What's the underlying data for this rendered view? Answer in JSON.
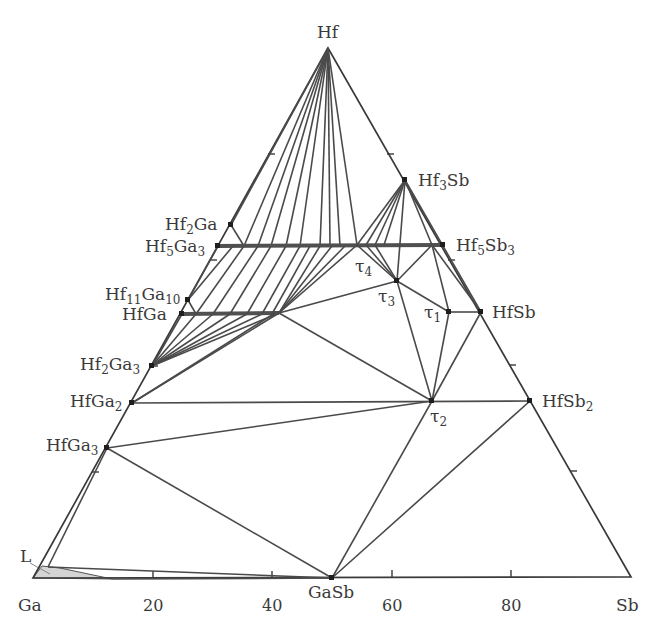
{
  "corners": {
    "top": {
      "label": "Hf",
      "x": 328,
      "y": 48
    },
    "left": {
      "label": "Ga",
      "x": 33,
      "y": 578
    },
    "right": {
      "label": "Sb",
      "x": 631,
      "y": 577
    }
  },
  "axis": {
    "bottom_ticks": [
      {
        "label": "20",
        "x": 153
      },
      {
        "label": "40",
        "x": 272
      },
      {
        "label": "60",
        "x": 392
      },
      {
        "label": "80",
        "x": 511
      }
    ]
  },
  "phases": [
    {
      "id": "Hf2Ga",
      "base": "Hf",
      "sub1": "2",
      "mid": "Ga",
      "sub2": "",
      "x": 231,
      "y": 225
    },
    {
      "id": "Hf5Ga3",
      "base": "Hf",
      "sub1": "5",
      "mid": "Ga",
      "sub2": "3",
      "x": 218,
      "y": 246
    },
    {
      "id": "Hf11Ga10",
      "base": "Hf",
      "sub1": "11",
      "mid": "Ga",
      "sub2": "10",
      "x": 188,
      "y": 300
    },
    {
      "id": "HfGa",
      "base": "HfGa",
      "sub1": "",
      "mid": "",
      "sub2": "",
      "x": 182,
      "y": 314
    },
    {
      "id": "Hf2Ga3",
      "base": "Hf",
      "sub1": "2",
      "mid": "Ga",
      "sub2": "3",
      "x": 152,
      "y": 366
    },
    {
      "id": "HfGa2",
      "base": "HfGa",
      "sub1": "2",
      "mid": "",
      "sub2": "",
      "x": 132,
      "y": 403
    },
    {
      "id": "HfGa3",
      "base": "HfGa",
      "sub1": "3",
      "mid": "",
      "sub2": "",
      "x": 107,
      "y": 448
    },
    {
      "id": "Hf3Sb",
      "base": "Hf",
      "sub1": "3",
      "mid": "Sb",
      "sub2": "",
      "x": 405,
      "y": 180
    },
    {
      "id": "Hf5Sb3",
      "base": "Hf",
      "sub1": "5",
      "mid": "Sb",
      "sub2": "3",
      "x": 443,
      "y": 245
    },
    {
      "id": "HfSb",
      "base": "HfSb",
      "sub1": "",
      "mid": "",
      "sub2": "",
      "x": 481,
      "y": 312
    },
    {
      "id": "HfSb2",
      "base": "HfSb",
      "sub1": "2",
      "mid": "",
      "sub2": "",
      "x": 530,
      "y": 401
    },
    {
      "id": "GaSb",
      "base": "GaSb",
      "sub1": "",
      "mid": "",
      "sub2": "",
      "x": 332,
      "y": 578
    },
    {
      "id": "tau1",
      "base": "τ",
      "sub1": "1",
      "mid": "",
      "sub2": "",
      "x": 449,
      "y": 312
    },
    {
      "id": "tau2",
      "base": "τ",
      "sub1": "2",
      "mid": "",
      "sub2": "",
      "x": 432,
      "y": 401
    },
    {
      "id": "tau3",
      "base": "τ",
      "sub1": "3",
      "mid": "",
      "sub2": "",
      "x": 397,
      "y": 281
    },
    {
      "id": "tau4",
      "base": "τ",
      "sub1": "4",
      "mid": "",
      "sub2": "",
      "x": 357,
      "y": 245
    }
  ],
  "labels": {
    "hf": "Hf",
    "ga": "Ga",
    "sb": "Sb",
    "hf2ga": {
      "a": "Hf",
      "s1": "2",
      "b": "Ga"
    },
    "hf5ga3": {
      "a": "Hf",
      "s1": "5",
      "b": "Ga",
      "s2": "3"
    },
    "hf11ga10": {
      "a": "Hf",
      "s1": "11",
      "b": "Ga",
      "s2": "10"
    },
    "hfga": {
      "a": "HfGa"
    },
    "hf2ga3": {
      "a": "Hf",
      "s1": "2",
      "b": "Ga",
      "s2": "3"
    },
    "hfga2": {
      "a": "HfGa",
      "s1": "2"
    },
    "hfga3": {
      "a": "HfGa",
      "s1": "3"
    },
    "hf3sb": {
      "a": "Hf",
      "s1": "3",
      "b": "Sb"
    },
    "hf5sb3": {
      "a": "Hf",
      "s1": "5",
      "b": "Sb",
      "s2": "3"
    },
    "hfsb": {
      "a": "HfSb"
    },
    "hfsb2": {
      "a": "HfSb",
      "s1": "2"
    },
    "gasb": {
      "a": "GaSb"
    },
    "tau1": {
      "a": "τ",
      "s1": "1"
    },
    "tau2": {
      "a": "τ",
      "s1": "2"
    },
    "tau3": {
      "a": "τ",
      "s1": "3"
    },
    "tau4": {
      "a": "τ",
      "s1": "4"
    },
    "liquid": "L"
  },
  "colors": {
    "line": "#4a4a4a",
    "point": "#1e1e1e",
    "liquid_fill": "#d4d4d4",
    "text": "#3a3a3a"
  }
}
